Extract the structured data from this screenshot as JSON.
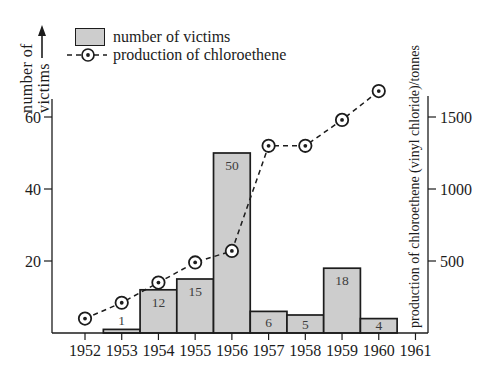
{
  "legend": {
    "items": [
      {
        "label": "number of victims",
        "marker": "bar-swatch"
      },
      {
        "label": "production of chloroethene",
        "marker": "dashed-line-circle"
      }
    ]
  },
  "colors": {
    "background": "#ffffff",
    "bar_fill": "#cdcdcd",
    "bar_border": "#1c1c1c",
    "line": "#1c1c1c",
    "text": "#1c1c1c",
    "bar_label_text": "#3d3d3d",
    "marker_fill": "#ffffff"
  },
  "chart_data": {
    "type": "combo-bar-line",
    "categories": [
      "1952",
      "1953",
      "1954",
      "1955",
      "1956",
      "1957",
      "1958",
      "1959",
      "1960",
      "1961"
    ],
    "series": [
      {
        "name": "number of victims",
        "type": "bar",
        "axis": "left",
        "values": [
          null,
          1,
          12,
          15,
          50,
          6,
          5,
          18,
          4,
          null
        ]
      },
      {
        "name": "production of chloroethene",
        "type": "line",
        "axis": "right",
        "style": "dashed-with-circle-markers",
        "values": [
          100,
          210,
          350,
          490,
          570,
          1300,
          1300,
          1480,
          1680,
          null
        ]
      }
    ],
    "left_axis": {
      "label": "number of victims",
      "label_lines": [
        "number of",
        "victims"
      ],
      "ticks": [
        20,
        40,
        60
      ],
      "range": [
        0,
        65
      ]
    },
    "right_axis": {
      "label": "production of chloroethene (vinyl chloride)/tonnes",
      "ticks": [
        500,
        1000,
        1500
      ],
      "range": [
        0,
        1630
      ]
    },
    "grid": false,
    "legend_position": "top-left"
  }
}
